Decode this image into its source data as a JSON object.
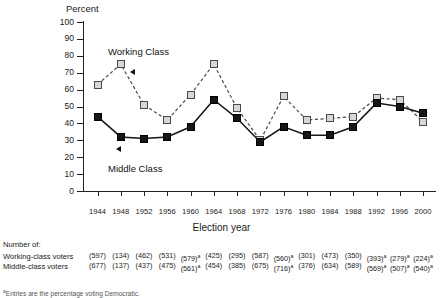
{
  "chart_data": {
    "type": "line",
    "title": "",
    "ylabel": "Percent",
    "xlabel": "Election year",
    "ylim": [
      0,
      100
    ],
    "yticks": [
      0,
      10,
      20,
      30,
      40,
      50,
      60,
      70,
      80,
      90,
      100
    ],
    "grid": false,
    "legend_position": "inline-annotations",
    "categories": [
      "1944",
      "1948",
      "1952",
      "1956",
      "1960",
      "1964",
      "1968",
      "1972",
      "1976",
      "1980",
      "1984",
      "1988",
      "1992",
      "1996",
      "2000"
    ],
    "series": [
      {
        "name": "Working Class",
        "marker": "light-gray-square",
        "line": "dashed",
        "values": [
          63,
          75,
          51,
          42,
          57,
          75,
          49,
          30,
          56,
          42,
          43,
          44,
          55,
          54,
          41
        ]
      },
      {
        "name": "Middle Class",
        "marker": "black-square",
        "line": "solid",
        "values": [
          44,
          32,
          31,
          32,
          38,
          54,
          43,
          29,
          38,
          33,
          33,
          38,
          52,
          50,
          46
        ]
      }
    ],
    "annotations": [
      {
        "text": "Working Class",
        "points_to_series": "Working Class"
      },
      {
        "text": "Middle Class",
        "points_to_series": "Middle Class"
      }
    ],
    "colors": {
      "working_class_fill": "#d6d6d6",
      "working_class_edge": "#4a4a4a",
      "middle_class_fill": "#161616",
      "axis": "#222222",
      "text": "#1a1a1a"
    }
  },
  "axis": {
    "y_title": "Percent",
    "x_title": "Election year",
    "y_ticks": [
      "100",
      "90",
      "80",
      "70",
      "60",
      "50",
      "40",
      "30",
      "20",
      "10",
      "0"
    ],
    "x_ticks": [
      "1944",
      "1948",
      "1952",
      "1956",
      "1960",
      "1964",
      "1968",
      "1972",
      "1976",
      "1980",
      "1984",
      "1988",
      "1992",
      "1996",
      "2000"
    ]
  },
  "annotations": {
    "working_class": "Working Class",
    "middle_class": "Middle Class"
  },
  "footer": {
    "title": "Number of:",
    "rows": [
      {
        "label": "Working-class voters",
        "values": [
          "(597)",
          "(134)",
          "(462)",
          "(531)",
          "(579)",
          "(425)",
          "(295)",
          "(587)",
          "(560)",
          "(301)",
          "(473)",
          "(350)",
          "(393)",
          "(279)",
          "(224)"
        ],
        "marks": [
          "",
          "",
          "",
          "",
          "a",
          "",
          "",
          "",
          "a",
          "",
          "",
          "",
          "a",
          "a",
          "a"
        ]
      },
      {
        "label": "Middle-class voters",
        "values": [
          "(677)",
          "(137)",
          "(437)",
          "(475)",
          "(561)",
          "(454)",
          "(385)",
          "(675)",
          "(716)",
          "(376)",
          "(634)",
          "(589)",
          "(569)",
          "(507)",
          "(540)"
        ],
        "marks": [
          "",
          "",
          "",
          "",
          "a",
          "",
          "",
          "",
          "a",
          "",
          "",
          "",
          "a",
          "a",
          "a"
        ]
      }
    ],
    "footnote_mark": "a",
    "footnote": "Entries are the percentage voting Democratic."
  }
}
